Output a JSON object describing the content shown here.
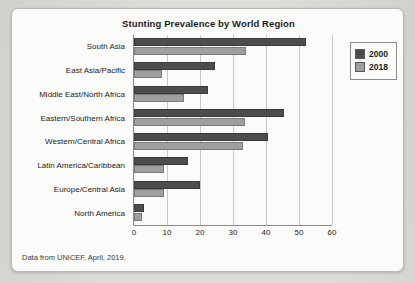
{
  "figure": {
    "title": "Stunting Prevalence by World Region",
    "footnote": "Data from UNICEF, April, 2019."
  },
  "legend": {
    "position": "top-right",
    "entries": [
      {
        "label": "2000",
        "color": "#4d4d4d"
      },
      {
        "label": "2018",
        "color": "#9f9f9c"
      }
    ]
  },
  "chart_data": {
    "type": "bar",
    "orientation": "horizontal",
    "title": "Stunting Prevalence by World Region",
    "subtitle": "",
    "xlabel": "",
    "ylabel": "",
    "xlim": [
      0,
      60
    ],
    "xticks": [
      0,
      10,
      20,
      30,
      40,
      50,
      60
    ],
    "grid": true,
    "grid_axis": "x",
    "legend_position": "top-right",
    "annotation": "Data from UNICEF, April, 2019.",
    "categories": [
      "South Asia",
      "East Asia/Pacific",
      "Middle East/North Africa",
      "Eastern/Southern Africa",
      "Western/Central Africa",
      "Latin America/Caribbean",
      "Europe/Central Asia",
      "North America"
    ],
    "series": [
      {
        "name": "2000",
        "color": "#4d4d4d",
        "values": [
          52,
          24.5,
          22.5,
          45.5,
          40.5,
          16.5,
          20,
          3
        ]
      },
      {
        "name": "2018",
        "color": "#9f9f9c",
        "values": [
          34,
          8.5,
          15,
          33.5,
          33,
          9,
          9,
          2.5
        ]
      }
    ]
  }
}
